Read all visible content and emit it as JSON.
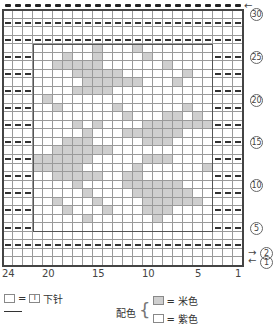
{
  "chart_data": {
    "type": "table",
    "title": "",
    "columns": 24,
    "rows": 30,
    "column_labels": [
      "24",
      "20",
      "15",
      "10",
      "5",
      "1"
    ],
    "row_labels": [
      "30",
      "25",
      "20",
      "15",
      "10",
      "5",
      "2",
      "1"
    ],
    "arrows": {
      "row30": "←",
      "row2": "→",
      "row1": "←"
    },
    "pattern_box": {
      "col_from": 21,
      "col_to": 4,
      "row_from": 27,
      "row_to": 4
    },
    "purl_rows_full": [
      29,
      3
    ],
    "purl_border_rows": [
      27,
      25,
      23,
      21,
      19,
      17,
      15,
      13,
      11,
      9,
      7,
      5
    ],
    "bind_off_row": 30,
    "gray_cells": [
      [
        26,
        [
          15,
          11
        ]
      ],
      [
        25,
        [
          18,
          15,
          10
        ]
      ],
      [
        24,
        [
          19,
          18,
          17,
          16,
          15,
          8
        ]
      ],
      [
        23,
        [
          17,
          16,
          15,
          14,
          13,
          6
        ]
      ],
      [
        22,
        [
          16,
          15,
          14,
          13,
          12,
          11,
          7
        ]
      ],
      [
        21,
        [
          17,
          16,
          15,
          14
        ]
      ],
      [
        20,
        [
          20
        ]
      ],
      [
        19,
        [
          19,
          13,
          6
        ]
      ],
      [
        18,
        [
          12,
          8,
          7,
          5
        ]
      ],
      [
        17,
        [
          17,
          15,
          10,
          9,
          8,
          7,
          6,
          5,
          4
        ]
      ],
      [
        16,
        [
          16,
          12,
          11,
          10,
          9,
          8,
          7
        ]
      ],
      [
        15,
        [
          18,
          17,
          16,
          10,
          9,
          8
        ]
      ],
      [
        14,
        [
          19,
          18,
          17,
          16,
          15,
          14
        ]
      ],
      [
        13,
        [
          21,
          20,
          19,
          18,
          17,
          16,
          10,
          9,
          8
        ]
      ],
      [
        12,
        [
          21,
          20,
          19,
          18,
          17,
          11,
          4
        ]
      ],
      [
        11,
        [
          19,
          18,
          17,
          16,
          15,
          12,
          11
        ]
      ],
      [
        10,
        [
          17,
          12,
          11,
          10,
          9,
          8,
          7
        ]
      ],
      [
        9,
        [
          16,
          11,
          10,
          9,
          8,
          7,
          6
        ]
      ],
      [
        8,
        [
          19,
          15,
          10,
          9,
          8,
          7,
          6,
          5
        ]
      ],
      [
        7,
        [
          18,
          14,
          10,
          9,
          8
        ]
      ],
      [
        6,
        [
          16,
          9
        ]
      ]
    ],
    "legend": [
      {
        "symbol": "empty-square",
        "equals": "I",
        "meaning": "下针"
      },
      {
        "group": "配色",
        "entries": [
          {
            "color": "#cfcfcf",
            "meaning": "米色"
          },
          {
            "color": "#ffffff",
            "meaning": "紫色"
          }
        ]
      }
    ]
  },
  "legend": {
    "knit_eq": "=",
    "knit_symbol": "I",
    "knit_label": "下针",
    "colorwork_label": "配色",
    "beige_label": "= 米色",
    "purple_label": "= 紫色"
  },
  "colors": {
    "gray": "#cfcfcf",
    "grid": "#9a9a9a",
    "frame": "#444444"
  }
}
